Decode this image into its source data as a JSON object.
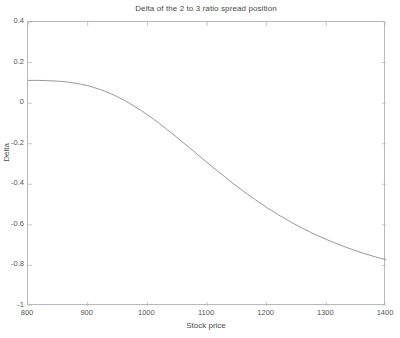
{
  "chart_data": {
    "type": "line",
    "title": "Delta of the 2 to 3 ratio spread position",
    "xlabel": "Stock price",
    "ylabel": "Delta",
    "xlim": [
      800,
      1400
    ],
    "ylim": [
      -1,
      0.4
    ],
    "xticks": [
      800,
      900,
      1000,
      1100,
      1200,
      1300,
      1400
    ],
    "xticklabels": [
      "800",
      "900",
      "1000",
      "1100",
      "1200",
      "1300",
      "1400"
    ],
    "yticks": [
      0.4,
      0.2,
      0,
      -0.2,
      -0.4,
      -0.6,
      -0.8,
      -1
    ],
    "yticklabels": [
      "0.4",
      "0.2",
      "0",
      "-0.2",
      "-0.4",
      "-0.6",
      "-0.8",
      "-1"
    ],
    "grid": false,
    "legend": null,
    "line_color": "#7d7d7d",
    "axis_color": "#b9b9b9",
    "background": "#ffffff",
    "series": [
      {
        "name": "Delta",
        "x": [
          800,
          820,
          840,
          860,
          880,
          900,
          920,
          940,
          960,
          980,
          1000,
          1020,
          1040,
          1060,
          1080,
          1100,
          1120,
          1140,
          1160,
          1180,
          1200,
          1220,
          1240,
          1260,
          1280,
          1300,
          1320,
          1340,
          1360,
          1380,
          1400
        ],
        "y": [
          0.112,
          0.112,
          0.11,
          0.106,
          0.098,
          0.086,
          0.068,
          0.045,
          0.016,
          -0.018,
          -0.057,
          -0.1,
          -0.146,
          -0.194,
          -0.243,
          -0.292,
          -0.34,
          -0.387,
          -0.432,
          -0.474,
          -0.514,
          -0.551,
          -0.585,
          -0.617,
          -0.646,
          -0.672,
          -0.696,
          -0.718,
          -0.738,
          -0.756,
          -0.772
        ]
      }
    ]
  }
}
